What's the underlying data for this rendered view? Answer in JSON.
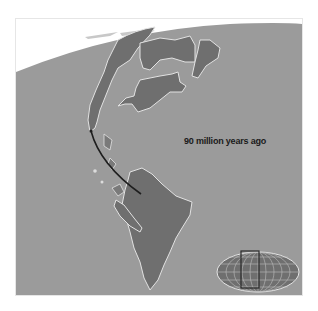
{
  "map": {
    "caption": "90 million years ago",
    "colors": {
      "ocean": "#9b9b9b",
      "land": "#6f6f6f",
      "coastline": "#e2e2e2",
      "sky": "#ffffff",
      "path": "#1e1e1e",
      "inset_frame": "#2a2a2a"
    },
    "inset": {
      "type": "world-locator-globe",
      "highlighted_region": "Americas"
    }
  }
}
